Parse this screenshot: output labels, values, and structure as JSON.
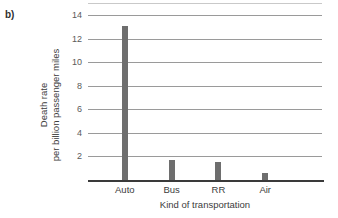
{
  "panel": {
    "label": "b)"
  },
  "chart_data": {
    "type": "bar",
    "title": "",
    "xlabel": "Kind of transportation",
    "ylabel_line1": "Death rate",
    "ylabel_line2": "per billion passenger miles",
    "categories": [
      "Auto",
      "Bus",
      "RR",
      "Air"
    ],
    "values": [
      13.1,
      1.7,
      1.5,
      0.6
    ],
    "ylim": [
      0,
      14
    ],
    "yticks": [
      14,
      12,
      10,
      8,
      6,
      4,
      2
    ],
    "ytick_labels": [
      "14",
      "12",
      "10",
      "8",
      "6",
      "4",
      "2"
    ],
    "grid": true,
    "legend": "none",
    "bar_color": "#6e6e6e",
    "gridline_color": "#9a9a9a",
    "axis_color": "#3a3a3a",
    "background_color": "#ffffff"
  }
}
